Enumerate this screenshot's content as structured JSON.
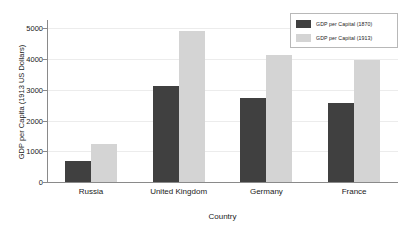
{
  "chart_data": {
    "type": "bar",
    "title": "",
    "subtitle": "",
    "xlabel": "Country",
    "ylabel": "GDP per Capita (1913 US Dollars)",
    "categories": [
      "Russia",
      "United Kingdom",
      "Germany",
      "France"
    ],
    "series": [
      {
        "name": "GDP per Capital (1870)",
        "color": "#404040",
        "values": [
          700,
          3130,
          2730,
          2560
        ]
      },
      {
        "name": "GDP per Capital (1913)",
        "color": "#d4d4d4",
        "values": [
          1230,
          4900,
          4130,
          3970
        ]
      }
    ],
    "ylim": [
      0,
      5200
    ],
    "yticks": [
      0,
      1000,
      2000,
      3000,
      4000,
      5000
    ],
    "ytick_labels": [
      "0",
      "1000",
      "2000",
      "3000",
      "4000",
      "5000"
    ],
    "grid": "horizontal",
    "legend_position": "top-right",
    "background_color": "#ffffff",
    "axis_color": "#8a8a8a",
    "gridline_color": "#ececec"
  }
}
